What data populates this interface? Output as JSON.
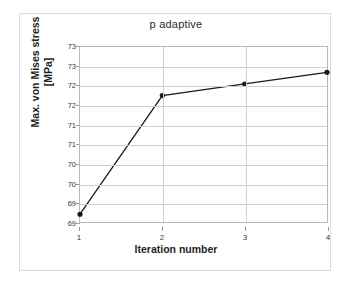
{
  "chart_data": {
    "type": "line",
    "title": "p adaptive",
    "xlabel": "Iteration number",
    "ylabel": "Max. von Mises stress [MPa]",
    "ylabel_lines": [
      "Max. von Mises stress",
      "[MPa]"
    ],
    "x": [
      1,
      2,
      3,
      4
    ],
    "values": [
      69.2,
      72.25,
      72.55,
      72.85
    ],
    "series": [
      {
        "name": "p adaptive",
        "values": [
          69.2,
          72.25,
          72.55,
          72.85
        ]
      }
    ],
    "xlim": [
      1,
      4
    ],
    "ylim": [
      69.0,
      73.5
    ],
    "xticks": [
      1,
      2,
      3,
      4
    ],
    "xtick_labels": [
      "1",
      "2",
      "3",
      "4"
    ],
    "yticks": [
      69.0,
      69.5,
      70.0,
      70.5,
      71.0,
      71.5,
      72.0,
      72.5,
      73.0,
      73.5
    ],
    "ytick_labels": [
      "69",
      "69",
      "70",
      "70",
      "71",
      "71",
      "72",
      "72",
      "73",
      "73"
    ],
    "grid": true,
    "legend": false,
    "marker": "circle",
    "line_color": "#1a1a1a",
    "marker_color": "#1a1a1a",
    "grid_color": "#d0d0d0",
    "plot_border_color": "#b8b8b8",
    "background_color": "#ffffff"
  }
}
